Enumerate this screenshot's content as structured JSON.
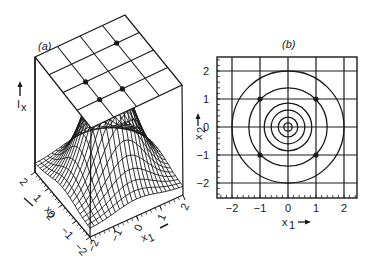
{
  "chart_data": [
    {
      "type": "surface",
      "panel_label": "(a)",
      "title": "",
      "xlabel": "x1",
      "ylabel": "x2",
      "zlabel": "Ix",
      "x_ticks": [
        "-2",
        "-1",
        "0",
        "1",
        "2"
      ],
      "y_ticks": [
        "-2",
        "-1",
        "0",
        "1",
        "2"
      ],
      "xlim": [
        -2,
        2
      ],
      "ylim": [
        -2,
        2
      ],
      "description": "3D wireframe of a single central peak (bell-shaped) over x1,x2 in [-2,2]; above it a tilted projection plane with a 4x4 grid and four marked dots",
      "plane_grid": {
        "rows": 4,
        "cols": 4
      },
      "plane_dots": [
        [
          1,
          2
        ],
        [
          3,
          1
        ],
        [
          2,
          3
        ],
        [
          1,
          3
        ]
      ]
    },
    {
      "type": "contour",
      "panel_label": "(b)",
      "title": "",
      "xlabel": "x1",
      "ylabel": "x2",
      "x_ticks": [
        "-2",
        "-1",
        "0",
        "1",
        "2"
      ],
      "y_ticks": [
        "-2",
        "-1",
        "0",
        "1",
        "2"
      ],
      "xlim": [
        -2.5,
        2.5
      ],
      "ylim": [
        -2.5,
        2.5
      ],
      "grid": true,
      "contour_radii": [
        0.15,
        0.35,
        0.6,
        0.85,
        1.4,
        2.0
      ],
      "center": [
        0,
        0
      ],
      "marked_points": [
        [
          -1,
          1
        ],
        [
          1,
          1
        ],
        [
          -1,
          -1
        ],
        [
          1,
          -1
        ]
      ]
    }
  ],
  "labels": {
    "a_panel": "(a)",
    "b_panel": "(b)",
    "ix_main": "I",
    "ix_sub": "x",
    "x1_main": "x",
    "x1_sub": "1",
    "x2_main": "x",
    "x2_sub": "2"
  },
  "ticks": {
    "b_x": [
      "−2",
      "−1",
      "0",
      "1",
      "2"
    ],
    "b_y": [
      "2",
      "1",
      "0",
      "−1",
      "−2"
    ],
    "a_x1": [
      "−2",
      "−1",
      "0",
      "1",
      "2"
    ],
    "a_x2": [
      "−2",
      "−1",
      "0",
      "1",
      "2"
    ]
  },
  "colors": {
    "ink": "#1a1a1a",
    "background": "#ffffff"
  }
}
